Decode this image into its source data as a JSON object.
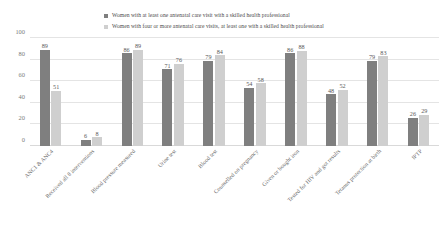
{
  "chart_data": {
    "type": "bar",
    "title": "",
    "subtitle": "",
    "xlabel": "",
    "ylabel": "",
    "ylim": [
      0,
      100
    ],
    "yticks": [
      0,
      20,
      40,
      60,
      80,
      100
    ],
    "grid": true,
    "legend_position": "top",
    "categories": [
      "ANC1 & ANC4",
      "Received all 8 interventions",
      "Blood pressure measured",
      "Urine test",
      "Blood test",
      "Counselled on pregnancy",
      "Given or bought iron",
      "Tested for HIV and got results",
      "Tetanus protection at birth",
      "IPTP"
    ],
    "series": [
      {
        "name": "Women with at least one antenatal care visit with a skilled health professional",
        "color": "#7f7f7f",
        "values": [
          89,
          6,
          86,
          71,
          79,
          54,
          86,
          48,
          79,
          26
        ]
      },
      {
        "name": "Women with four or more antenatal care visits, at least one with a skilled health professional",
        "color": "#cfcfcf",
        "values": [
          51,
          8,
          89,
          76,
          84,
          58,
          88,
          52,
          83,
          29
        ]
      }
    ]
  },
  "legend": {
    "entries": [
      {
        "label": "Women with at least one antenatal care visit with a skilled health professional",
        "marker": "square-dark"
      },
      {
        "label": "Women with four or more antenatal care visits, at least one with a skilled health professional",
        "marker": "square-light"
      }
    ]
  },
  "axes": {
    "y_tick_labels": [
      "100",
      "80",
      "60",
      "40",
      "20",
      "0"
    ]
  }
}
